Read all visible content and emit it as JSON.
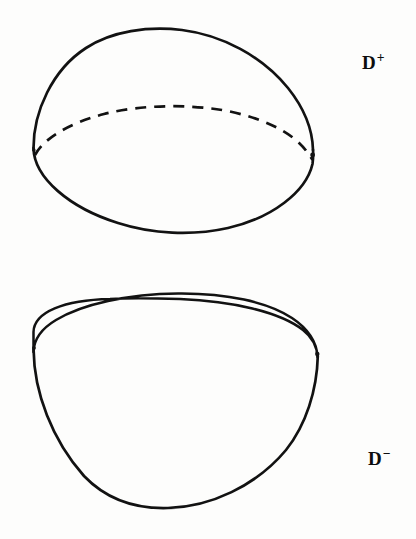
{
  "figure": {
    "background_color": "#fdfdfc",
    "ink_color": "#121212",
    "caption": "",
    "labels": {
      "upper": {
        "base": "D",
        "superscript": "+",
        "full": "D+",
        "x": 362,
        "y": 53
      },
      "lower": {
        "base": "D",
        "superscript": "−",
        "full": "D−",
        "x": 368,
        "y": 449
      }
    },
    "shapes": [
      {
        "name": "upper-hemisphere",
        "label": "D+",
        "description": "Upper half-disk drawn as a dome: solid outer dome outline, solid front half of equator arc, dashed hidden back half of equator arc",
        "bounds": {
          "x_min": 33,
          "x_max": 313,
          "y_min": 30,
          "y_max": 236
        },
        "equator": {
          "center_x": 173,
          "center_y": 146,
          "rx": 140,
          "ry": 35
        },
        "dome_apex_y": 30,
        "stroke_width": 2.6
      },
      {
        "name": "lower-hemisphere",
        "label": "D−",
        "description": "Lower half-disk drawn as a bowl: full solid ellipse rim on top, solid bowl outline below",
        "bounds": {
          "x_min": 33,
          "x_max": 318,
          "y_min": 298,
          "y_max": 508
        },
        "rim": {
          "center_x": 175,
          "center_y": 335,
          "rx": 142,
          "ry": 37
        },
        "bowl_bottom_y": 508,
        "stroke_width": 2.6
      }
    ]
  }
}
